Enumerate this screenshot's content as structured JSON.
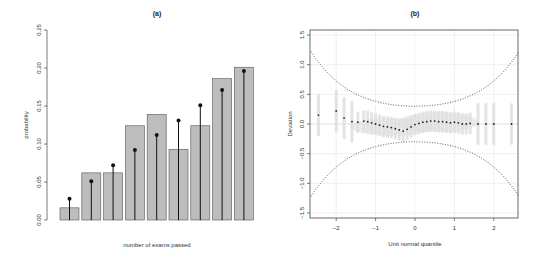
{
  "chart_data": [
    {
      "type": "bar",
      "title": "(a)",
      "xlabel": "number of exams passed",
      "ylabel": "probability",
      "ylim": [
        0,
        0.25
      ],
      "yticks": [
        "0.00",
        "0.05",
        "0.10",
        "0.15",
        "0.20",
        "0.25"
      ],
      "grid": false,
      "categories": [
        "0",
        "1",
        "2",
        "3",
        "4",
        "5",
        "6",
        "7",
        "8"
      ],
      "series": [
        {
          "name": "observed",
          "style": "grey bars",
          "values": [
            0.016,
            0.062,
            0.062,
            0.124,
            0.139,
            0.093,
            0.124,
            0.186,
            0.201
          ]
        },
        {
          "name": "expected",
          "style": "black lollipop",
          "values": [
            0.028,
            0.051,
            0.072,
            0.092,
            0.112,
            0.131,
            0.151,
            0.171,
            0.196
          ]
        }
      ]
    },
    {
      "type": "scatter",
      "title": "(b)",
      "xlabel": "Unit normal quantile",
      "ylabel": "Deviation",
      "xlim": [
        -2.64,
        2.64
      ],
      "ylim": [
        -1.5,
        1.5
      ],
      "xticks": [
        "-2",
        "-1",
        "0",
        "1",
        "2"
      ],
      "yticks": [
        "-1.5",
        "-1.0",
        "-0.5",
        "0.0",
        "0.5",
        "1.0",
        "1.5"
      ],
      "grid": true,
      "series": [
        {
          "name": "median trend",
          "style": "black dots",
          "x": [
            -2.45,
            -2.0,
            -1.8,
            -1.6,
            -1.45,
            -1.3,
            -1.2,
            -1.1,
            -1.0,
            -0.9,
            -0.8,
            -0.7,
            -0.6,
            -0.5,
            -0.4,
            -0.3,
            -0.2,
            -0.1,
            0.0,
            0.1,
            0.2,
            0.3,
            0.4,
            0.5,
            0.6,
            0.7,
            0.8,
            0.9,
            1.0,
            1.1,
            1.2,
            1.3,
            1.4,
            1.6,
            1.8,
            2.0,
            2.45
          ],
          "y": [
            0.15,
            0.22,
            0.1,
            0.04,
            0.03,
            0.05,
            0.04,
            0.02,
            0.0,
            -0.02,
            -0.04,
            -0.05,
            -0.06,
            -0.08,
            -0.1,
            -0.12,
            -0.09,
            -0.05,
            -0.01,
            0.01,
            0.03,
            0.04,
            0.05,
            0.05,
            0.04,
            0.04,
            0.03,
            0.02,
            0.03,
            0.02,
            0.0,
            0.0,
            0.01,
            0.0,
            0.0,
            0.0,
            0.0
          ]
        },
        {
          "name": "confidence bounds",
          "style": "dotted curves",
          "upper_at_edges": 1.22,
          "upper_at_center": 0.3,
          "lower_at_edges": -1.22,
          "lower_at_center": -0.3
        }
      ]
    }
  ]
}
